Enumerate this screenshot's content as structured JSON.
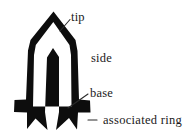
{
  "figure": {
    "type": "annotated-line-drawing",
    "background_color": "#ffffff",
    "ink_color": "#0d0d0d",
    "text_color": "#1a1a1a",
    "leader_color": "#2b2b2b",
    "labels": [
      {
        "id": "tip",
        "text": "tip",
        "x": 71,
        "y": 21,
        "has_leader": true,
        "leader_from_x": 70,
        "leader_from_y": 19,
        "leader_to_x": 60,
        "leader_to_y": 31
      },
      {
        "id": "side",
        "text": "side",
        "x": 91,
        "y": 62,
        "has_leader": false
      },
      {
        "id": "base",
        "text": "base",
        "x": 90,
        "y": 97,
        "has_leader": true,
        "leader_from_x": 88,
        "leader_from_y": 94,
        "leader_to_x": 68,
        "leader_to_y": 108
      },
      {
        "id": "associated-ring",
        "text": "associated ring",
        "x": 103,
        "y": 124,
        "has_leader": true,
        "leader_from_x": 96,
        "leader_from_y": 120,
        "leader_to_x": 78,
        "leader_to_y": 120
      }
    ]
  }
}
